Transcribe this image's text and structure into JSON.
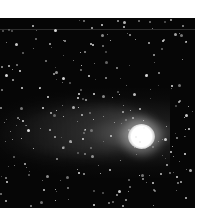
{
  "image": {
    "subject": "comet with tail against starfield",
    "description": "Black-and-white astronomical photograph of a comet; bright nucleus at right with a faint tail extending to the left, surrounded by many stars.",
    "colors": {
      "background": "#ffffff",
      "sky": "#060606",
      "nucleus": "#ffffff",
      "stars": "#e8e8e8"
    }
  }
}
